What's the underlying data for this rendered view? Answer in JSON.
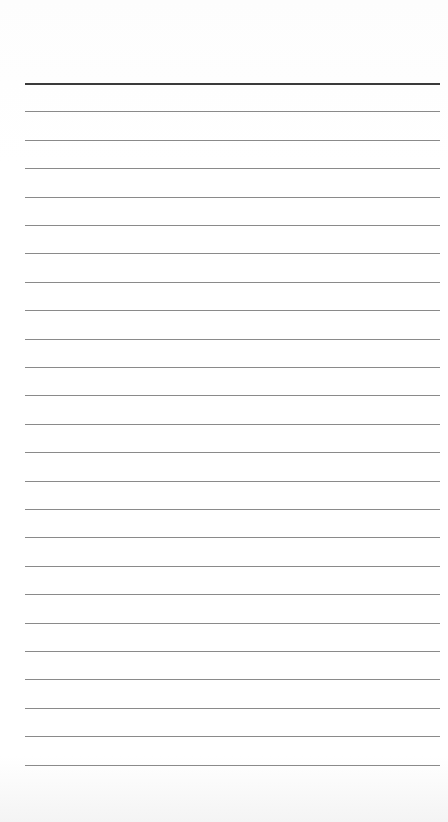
{
  "page": {
    "type": "lined-notepad",
    "background_color": "#ffffff",
    "header_line_color": "#3a3a3a",
    "rule_line_color": "#8a8a8a",
    "line_count": 25,
    "first_line_y": 83,
    "line_spacing": 28.4,
    "line_left": 25,
    "line_width": 415
  }
}
